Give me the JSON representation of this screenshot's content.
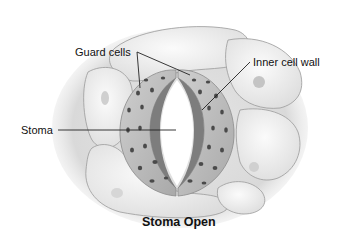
{
  "diagram": {
    "title": "Stoma Open",
    "labels": {
      "guard_cells": "Guard cells",
      "inner_cell_wall": "Inner cell wall",
      "stoma": "Stoma"
    }
  },
  "colors": {
    "background": "#ffffff",
    "epidermal_cell_fill": "#f1f1f1",
    "epidermal_cell_edge": "#9a9a9a",
    "guard_cell_fill": "#bdbdbd",
    "inner_wall": "#7d7d7d",
    "chloroplast": "#4a4a4a",
    "pore": "#ffffff",
    "text": "#111111"
  }
}
